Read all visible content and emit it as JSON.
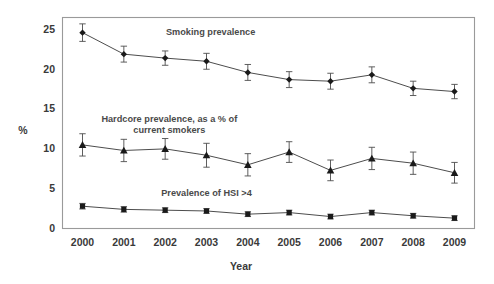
{
  "figure": {
    "background_color": "#ffffff",
    "plot_border_color": "#9a9a9a",
    "line_color": "#4d4d4d",
    "marker_color": "#1a1a1a",
    "text_color": "#3a3a3a"
  },
  "chart_data": {
    "type": "line",
    "title": "",
    "subtitle": "",
    "xlabel": "Year",
    "ylabel": "%",
    "x": [
      2000,
      2001,
      2002,
      2003,
      2004,
      2005,
      2006,
      2007,
      2008,
      2009
    ],
    "categories": [
      "2000",
      "2001",
      "2002",
      "2003",
      "2004",
      "2005",
      "2006",
      "2007",
      "2008",
      "2009"
    ],
    "xtick_labels": [
      "2000",
      "2001",
      "2002",
      "2003",
      "2004",
      "2005",
      "2006",
      "2007",
      "2008",
      "2009"
    ],
    "ytick_labels": [
      "0",
      "5",
      "10",
      "15",
      "20",
      "25"
    ],
    "yticks": [
      0,
      5,
      10,
      15,
      20,
      25
    ],
    "ylim": [
      0,
      26.5
    ],
    "grid": false,
    "legend_position": "inline-annotations",
    "error_bars": true,
    "series": [
      {
        "name": "Smoking prevalence",
        "marker": "diamond",
        "annotation": "Smoking prevalence",
        "annotation_x": 2003.1,
        "annotation_y": 24.6,
        "values": [
          24.6,
          21.9,
          21.4,
          21.0,
          19.6,
          18.7,
          18.5,
          19.3,
          17.6,
          17.2
        ],
        "err_low": [
          1.1,
          1.0,
          0.9,
          1.0,
          1.0,
          1.0,
          1.0,
          1.0,
          0.9,
          0.9
        ],
        "err_high": [
          1.1,
          1.0,
          0.9,
          1.0,
          1.0,
          1.0,
          1.0,
          1.0,
          0.9,
          0.9
        ]
      },
      {
        "name": "Hardcore prevalence, as a % of current smokers",
        "marker": "triangle",
        "annotation_line1": "Hardcore prevalence, as a % of",
        "annotation_line2": "current smokers",
        "annotation_x": 2002.1,
        "annotation_y": 13.6,
        "values": [
          10.5,
          9.8,
          10.0,
          9.2,
          8.0,
          9.6,
          7.3,
          8.8,
          8.2,
          7.0
        ],
        "err_low": [
          1.4,
          1.4,
          1.3,
          1.5,
          1.4,
          1.3,
          1.3,
          1.4,
          1.4,
          1.3
        ],
        "err_high": [
          1.4,
          1.4,
          1.3,
          1.5,
          1.4,
          1.3,
          1.3,
          1.4,
          1.4,
          1.3
        ]
      },
      {
        "name": "Prevalence of HSI >4",
        "marker": "square",
        "annotation": "Prevalence of HSI >4",
        "annotation_x": 2003.0,
        "annotation_y": 4.4,
        "values": [
          2.8,
          2.4,
          2.3,
          2.2,
          1.8,
          2.0,
          1.5,
          2.0,
          1.6,
          1.3
        ],
        "err_low": [
          0.35,
          0.35,
          0.3,
          0.3,
          0.3,
          0.3,
          0.3,
          0.3,
          0.3,
          0.3
        ],
        "err_high": [
          0.35,
          0.35,
          0.3,
          0.3,
          0.3,
          0.3,
          0.3,
          0.3,
          0.3,
          0.3
        ]
      }
    ]
  }
}
